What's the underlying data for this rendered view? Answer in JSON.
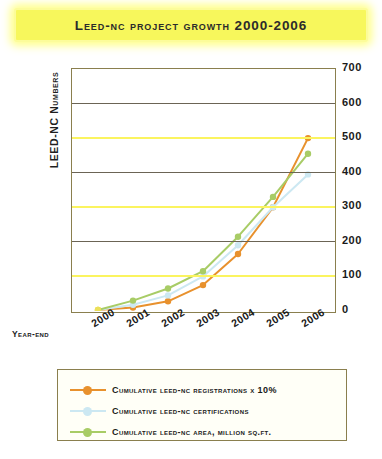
{
  "title": "LEED-NC Project Growth 2000-2006",
  "axes": {
    "y_title": "LEED-NC Numbers",
    "x_title": "Year-End",
    "y_ticks": [
      "700",
      "600",
      "500",
      "400",
      "300",
      "200",
      "100",
      "0"
    ]
  },
  "legend": {
    "items": [
      {
        "label": "Cumulative LEED-NC Registrations x 10%",
        "color": "#E8912D",
        "marker": "dot"
      },
      {
        "label": "Cumulative LEED-NC Certifications",
        "color": "#CCE8F2",
        "marker": "dot"
      },
      {
        "label": "Cumulative LEED-NC Area, million sq.ft.",
        "color": "#A8CC66",
        "marker": "dot"
      }
    ]
  },
  "colors": {
    "banner": "#f7f75c",
    "banner_inner_border": "#fcfc9a",
    "frame": "#8a7f4e",
    "grid_yellow": "#fbf45f",
    "grid_dark": "#6b6455",
    "registrations": "#E8912D",
    "certifications": "#CCE8F2",
    "area": "#A8CC66",
    "origin_marker": "#ece05a"
  },
  "chart_data": {
    "type": "line",
    "title": "LEED-NC Project Growth 2000-2006",
    "xlabel": "Year-End",
    "ylabel": "LEED-NC Numbers",
    "categories": [
      "2000",
      "2001",
      "2002",
      "2003",
      "2004",
      "2005",
      "2006"
    ],
    "ylim": [
      0,
      700
    ],
    "ytick_step": 100,
    "grid": true,
    "legend_position": "bottom",
    "series": [
      {
        "name": "Cumulative LEED-NC Registrations x 10%",
        "color": "#E8912D",
        "values": [
          3,
          10,
          28,
          75,
          165,
          300,
          500
        ]
      },
      {
        "name": "Cumulative LEED-NC Certifications",
        "color": "#CCE8F2",
        "values": [
          3,
          18,
          45,
          100,
          190,
          300,
          395
        ]
      },
      {
        "name": "Cumulative LEED-NC Area, million sq.ft.",
        "color": "#A8CC66",
        "values": [
          3,
          30,
          65,
          115,
          215,
          330,
          455
        ]
      }
    ]
  }
}
